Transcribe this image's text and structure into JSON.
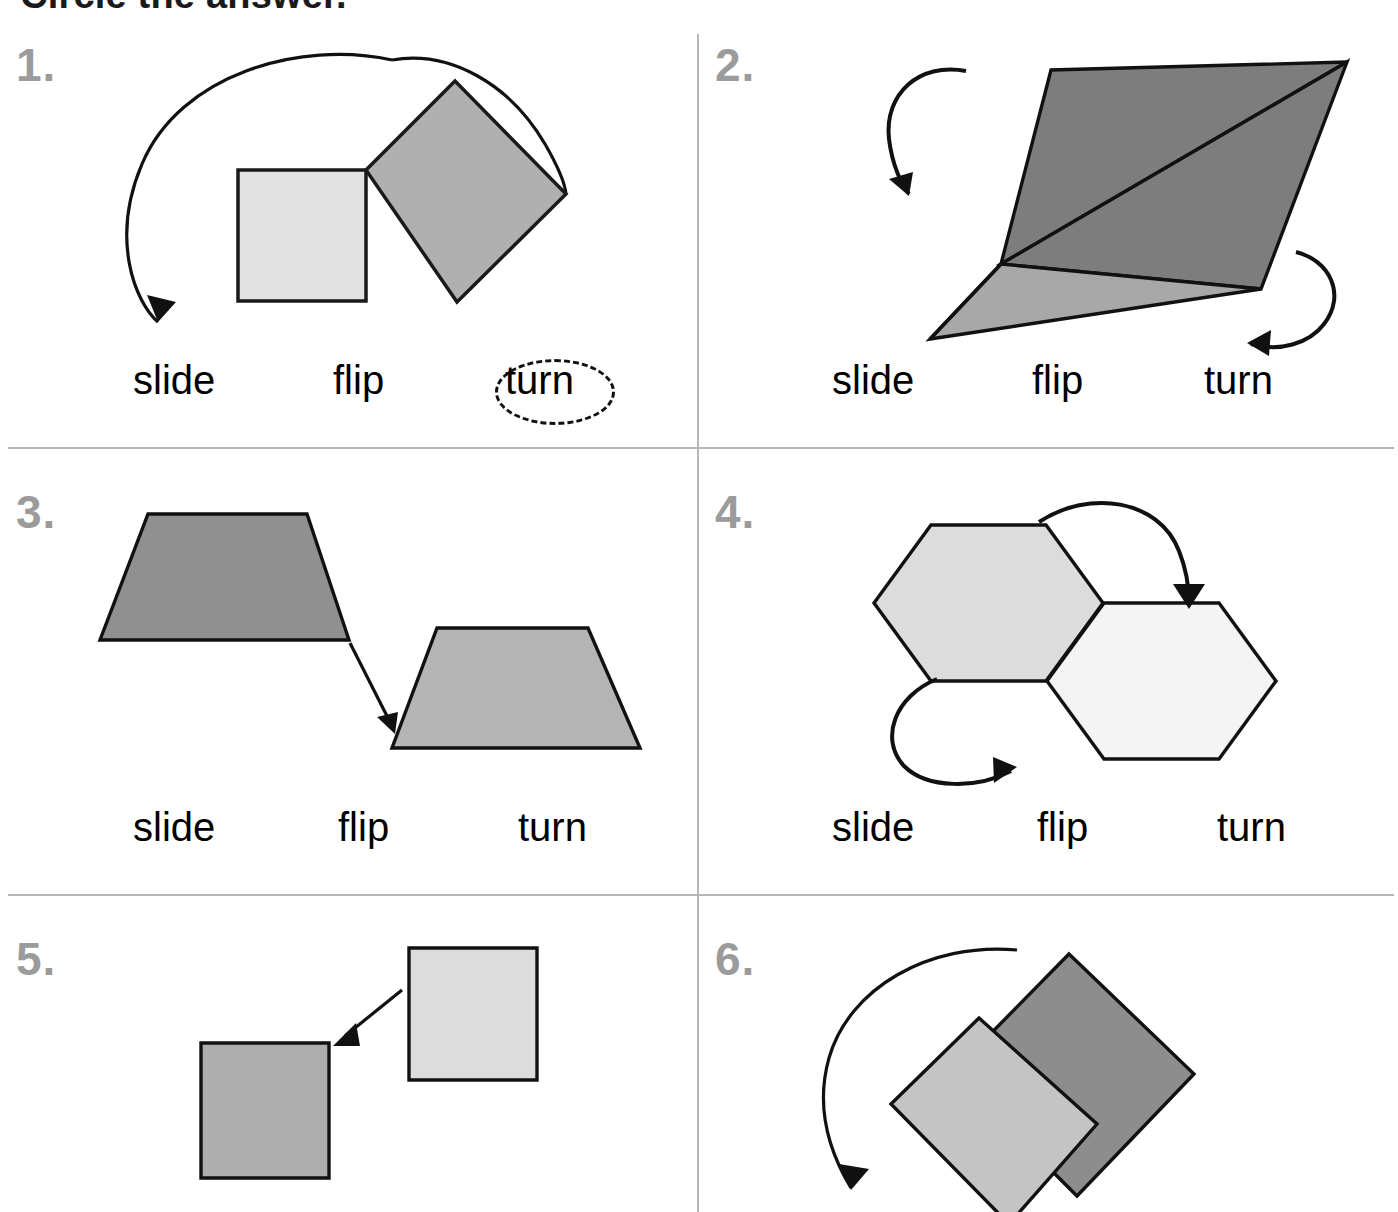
{
  "worksheet": {
    "title": "Circle the answer.",
    "choice_labels": [
      "slide",
      "flip",
      "turn"
    ]
  },
  "problems": [
    {
      "number": "1.",
      "figure": "square-rotated-about-corner",
      "motion": "turn",
      "choices": [
        "slide",
        "flip",
        "turn"
      ],
      "selected": "turn",
      "selected_index": 2,
      "shapes": [
        {
          "name": "light-square",
          "fill": "#e2e2e2"
        },
        {
          "name": "gray-diamond",
          "fill": "#b0b0b0"
        }
      ],
      "arrow": "large-curved-arrow-counterclockwise"
    },
    {
      "number": "2.",
      "figure": "kite-split-into-two-triangles",
      "motion": "flip",
      "choices": [
        "slide",
        "flip",
        "turn"
      ],
      "selected": null,
      "selected_index": null,
      "shapes": [
        {
          "name": "dark-triangle",
          "fill": "#7d7d7d"
        },
        {
          "name": "light-triangle",
          "fill": "#a8a8a8"
        }
      ],
      "arrow": "two-curved-flip-arrows"
    },
    {
      "number": "3.",
      "figure": "two-trapezoids-translated",
      "motion": "slide",
      "choices": [
        "slide",
        "flip",
        "turn"
      ],
      "selected": null,
      "selected_index": null,
      "shapes": [
        {
          "name": "dark-trapezoid",
          "fill": "#909090"
        },
        {
          "name": "light-trapezoid",
          "fill": "#b4b4b4"
        }
      ],
      "arrow": "straight-diagonal-arrow-down-right"
    },
    {
      "number": "4.",
      "figure": "two-hexagons-side-by-side",
      "motion": "flip",
      "choices": [
        "slide",
        "flip",
        "turn"
      ],
      "selected": null,
      "selected_index": null,
      "shapes": [
        {
          "name": "light-gray-hexagon",
          "fill": "#dcdcdc"
        },
        {
          "name": "white-hexagon",
          "fill": "#f4f4f4"
        }
      ],
      "arrow": "two-curved-flip-arrows"
    },
    {
      "number": "5.",
      "figure": "two-squares-translated",
      "motion": "slide",
      "choices": [],
      "selected": null,
      "selected_index": null,
      "shapes": [
        {
          "name": "light-square",
          "fill": "#dcdcdc"
        },
        {
          "name": "medium-square",
          "fill": "#adadad"
        }
      ],
      "arrow": "straight-diagonal-arrow-down-left"
    },
    {
      "number": "6.",
      "figure": "square-rotated-about-corner",
      "motion": "turn",
      "choices": [],
      "selected": null,
      "selected_index": null,
      "shapes": [
        {
          "name": "dark-diamond",
          "fill": "#8d8d8d"
        },
        {
          "name": "light-rotated-square",
          "fill": "#c4c4c4"
        }
      ],
      "arrow": "large-curved-arrow-counterclockwise"
    }
  ]
}
